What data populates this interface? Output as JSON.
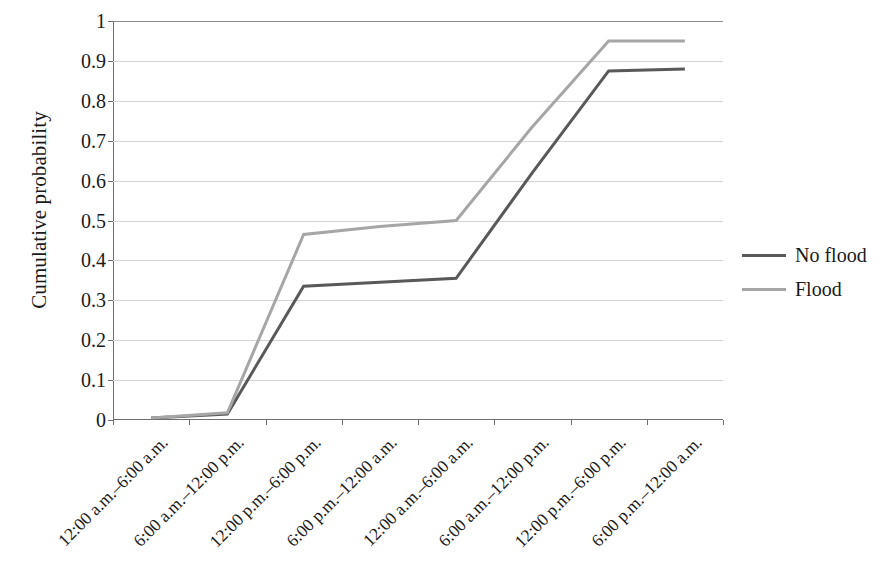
{
  "chart_data": {
    "type": "line",
    "title": "",
    "xlabel": "",
    "ylabel": "Cumulative probability",
    "ylim": [
      0,
      1
    ],
    "yticks": [
      "0",
      "0.1",
      "0.2",
      "0.3",
      "0.4",
      "0.5",
      "0.6",
      "0.7",
      "0.8",
      "0.9",
      "1"
    ],
    "ytick_values": [
      0,
      0.1,
      0.2,
      0.3,
      0.4,
      0.5,
      0.6,
      0.7,
      0.8,
      0.9,
      1
    ],
    "grid": true,
    "legend_position": "right",
    "categories": [
      "12:00 a.m.–6:00 a.m.",
      "6:00 a.m.–12:00 p.m.",
      "12:00 p.m.–6:00 p.m.",
      "6:00 p.m.–12:00 a.m.",
      "12:00 a.m.–6:00 a.m.",
      "6:00 a.m.–12:00 p.m.",
      "12:00 p.m.–6:00 p.m.",
      "6:00 p.m.–12:00 a.m."
    ],
    "series": [
      {
        "name": "No flood",
        "color": "#595959",
        "values": [
          0.005,
          0.015,
          0.335,
          0.345,
          0.355,
          0.62,
          0.875,
          0.88
        ]
      },
      {
        "name": "Flood",
        "color": "#a6a6a6",
        "values": [
          0.005,
          0.018,
          0.465,
          0.485,
          0.5,
          0.735,
          0.95,
          0.95
        ]
      }
    ]
  },
  "legend": {
    "entries": [
      {
        "label": "No flood",
        "color": "#595959"
      },
      {
        "label": "Flood",
        "color": "#a6a6a6"
      }
    ]
  },
  "axes": {
    "y_title": "Cumulative probability"
  }
}
